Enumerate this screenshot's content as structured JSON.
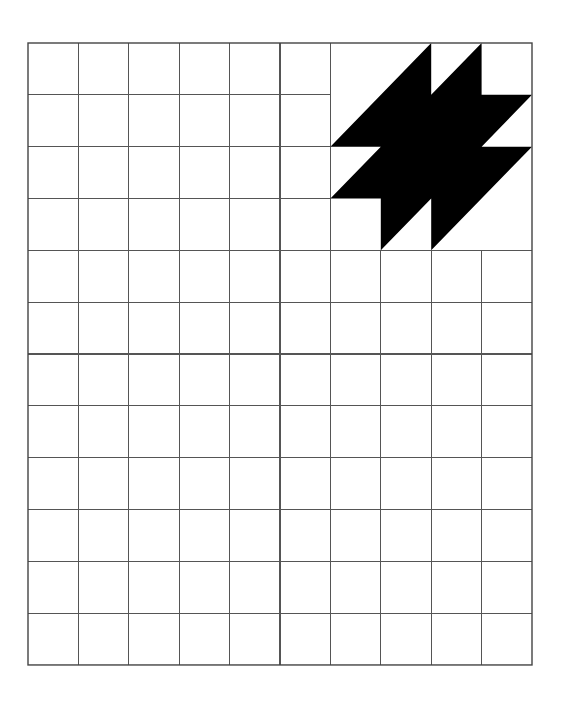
{
  "diagram": {
    "type": "grid-with-shape",
    "grid": {
      "columns": 10,
      "rows": 12,
      "origin_px": [
        28,
        43
      ],
      "cell_width_px": 50.4,
      "cell_height_px": 51.83,
      "line_color": "#555555",
      "background": "#ffffff"
    },
    "blank_block": {
      "description": "top-right region without inner grid lines",
      "col_start": 6,
      "row_start": 0,
      "cols": 4,
      "rows": 4
    },
    "shape": {
      "name": "black-zigzag-polygon",
      "fill": "#000000",
      "points_in_cells": [
        [
          8,
          0
        ],
        [
          8,
          1
        ],
        [
          9,
          0
        ],
        [
          9,
          1
        ],
        [
          10,
          1
        ],
        [
          9,
          2
        ],
        [
          10,
          2
        ],
        [
          8,
          4
        ],
        [
          8,
          3
        ],
        [
          7,
          4
        ],
        [
          7,
          3
        ],
        [
          6,
          3
        ],
        [
          7,
          2
        ],
        [
          6,
          2
        ]
      ]
    }
  }
}
